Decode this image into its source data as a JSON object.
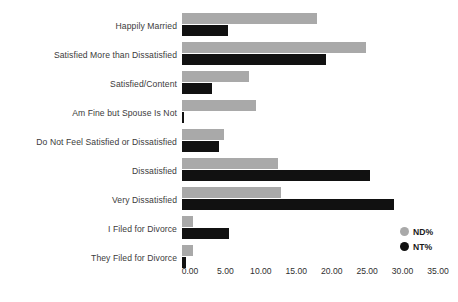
{
  "chart_data": {
    "type": "bar",
    "orientation": "horizontal",
    "title": "",
    "xlabel": "",
    "ylabel": "",
    "grid": false,
    "legend_position": "right-bottom",
    "xlim": [
      0,
      35
    ],
    "xticks": [
      "0.00",
      "5.00",
      "10.00",
      "15.00",
      "20.00",
      "25.00",
      "30.00",
      "35.00"
    ],
    "xtick_values": [
      0,
      5,
      10,
      15,
      20,
      25,
      30,
      35
    ],
    "categories": [
      "Happily Married",
      "Satisfied More than Dissatisfied",
      "Satisfied/Content",
      "Am Fine but Spouse Is Not",
      "Do Not Feel Satisfied or Dissatisfied",
      "Dissatisfied",
      "Very Dissatisfied",
      "I Filed for Divorce",
      "They Filed for Divorce"
    ],
    "series": [
      {
        "name": "ND%",
        "color": "#a9a9a9",
        "values": [
          19.0,
          25.9,
          9.5,
          10.4,
          5.9,
          13.5,
          14.0,
          1.5,
          1.6
        ]
      },
      {
        "name": "NT%",
        "color": "#111111",
        "values": [
          6.5,
          20.3,
          4.2,
          0.3,
          5.2,
          26.6,
          29.9,
          6.6,
          0.6
        ]
      }
    ]
  },
  "legend": {
    "items": [
      {
        "label": "ND%",
        "color": "#a9a9a9"
      },
      {
        "label": "NT%",
        "color": "#111111"
      }
    ]
  },
  "colors": {
    "background": "#ffffff",
    "nd_series": "#a9a9a9",
    "nt_series": "#111111",
    "label_text": "#3b3b3b",
    "tick_text": "#2f2f2f"
  }
}
